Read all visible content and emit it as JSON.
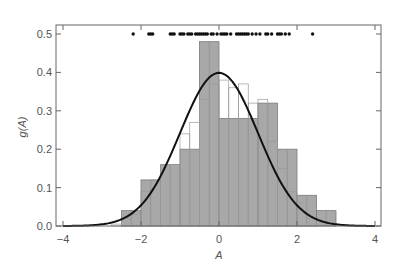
{
  "chart_data": {
    "type": "bar",
    "title": "",
    "xlabel": "A",
    "ylabel": "g(A)",
    "xlim": [
      -4,
      4
    ],
    "ylim": [
      0,
      0.52
    ],
    "xticks": [
      -4,
      -2,
      0,
      2,
      4
    ],
    "xtick_labels": [
      "−4",
      "−2",
      "0",
      "2",
      "4"
    ],
    "yticks": [
      0.0,
      0.1,
      0.2,
      0.3,
      0.4,
      0.5
    ],
    "ytick_labels": [
      "0.0",
      "0.1",
      "0.2",
      "0.3",
      "0.4",
      "0.5"
    ],
    "grid": false,
    "legend": null,
    "series": [
      {
        "name": "histogram (0.5 bins, shaded)",
        "kind": "bar",
        "color": "#a8a8a8",
        "edgecolor": "#7a7a7a",
        "bins": [
          {
            "x0": -2.5,
            "x1": -2.0,
            "value": 0.04
          },
          {
            "x0": -2.0,
            "x1": -1.5,
            "value": 0.12
          },
          {
            "x0": -1.5,
            "x1": -1.0,
            "value": 0.16
          },
          {
            "x0": -1.0,
            "x1": -0.5,
            "value": 0.2
          },
          {
            "x0": -0.5,
            "x1": 0.0,
            "value": 0.48
          },
          {
            "x0": 0.0,
            "x1": 0.5,
            "value": 0.28
          },
          {
            "x0": 0.5,
            "x1": 1.0,
            "value": 0.28
          },
          {
            "x0": 1.0,
            "x1": 1.5,
            "value": 0.32
          },
          {
            "x0": 1.5,
            "x1": 2.0,
            "value": 0.2
          },
          {
            "x0": 2.0,
            "x1": 2.5,
            "value": 0.08
          },
          {
            "x0": 2.5,
            "x1": 3.0,
            "value": 0.04
          }
        ]
      },
      {
        "name": "histogram (0.25 bins, outline)",
        "kind": "bar-outline",
        "color": "#9a9a9a",
        "bins": [
          {
            "x0": -2.75,
            "x1": -2.5,
            "value": 0.005
          },
          {
            "x0": -2.5,
            "x1": -2.25,
            "value": 0.02
          },
          {
            "x0": -2.25,
            "x1": -2.0,
            "value": 0.03
          },
          {
            "x0": -2.0,
            "x1": -1.75,
            "value": 0.09
          },
          {
            "x0": -1.75,
            "x1": -1.5,
            "value": 0.12
          },
          {
            "x0": -1.5,
            "x1": -1.25,
            "value": 0.16
          },
          {
            "x0": -1.25,
            "x1": -1.0,
            "value": 0.16
          },
          {
            "x0": -1.0,
            "x1": -0.75,
            "value": 0.24
          },
          {
            "x0": -0.75,
            "x1": -0.5,
            "value": 0.27
          },
          {
            "x0": -0.5,
            "x1": -0.25,
            "value": 0.33
          },
          {
            "x0": -0.25,
            "x1": 0.0,
            "value": 0.37
          },
          {
            "x0": 0.0,
            "x1": 0.25,
            "value": 0.38
          },
          {
            "x0": 0.25,
            "x1": 0.5,
            "value": 0.36
          },
          {
            "x0": 0.5,
            "x1": 0.75,
            "value": 0.37
          },
          {
            "x0": 0.75,
            "x1": 1.0,
            "value": 0.32
          },
          {
            "x0": 1.0,
            "x1": 1.25,
            "value": 0.33
          },
          {
            "x0": 1.25,
            "x1": 1.5,
            "value": 0.22
          },
          {
            "x0": 1.5,
            "x1": 1.75,
            "value": 0.15
          },
          {
            "x0": 1.75,
            "x1": 2.0,
            "value": 0.09
          },
          {
            "x0": 2.0,
            "x1": 2.25,
            "value": 0.06
          },
          {
            "x0": 2.25,
            "x1": 2.5,
            "value": 0.02
          }
        ]
      },
      {
        "name": "normal density",
        "kind": "line",
        "color": "#111111",
        "mean": 0,
        "sd": 1,
        "peak": 0.399
      },
      {
        "name": "samples",
        "kind": "scatter",
        "y": 0.5,
        "color": "#111111",
        "x": [
          -2.2,
          -1.8,
          -1.75,
          -1.7,
          -1.25,
          -1.2,
          -1.15,
          -1.0,
          -0.95,
          -0.9,
          -0.8,
          -0.75,
          -0.7,
          -0.6,
          -0.55,
          -0.5,
          -0.45,
          -0.4,
          -0.35,
          -0.3,
          -0.2,
          -0.15,
          -0.05,
          0.05,
          0.1,
          0.15,
          0.2,
          0.3,
          0.45,
          0.5,
          0.55,
          0.6,
          0.65,
          0.7,
          0.75,
          0.85,
          0.95,
          1.05,
          1.2,
          1.25,
          1.35,
          1.5,
          1.55,
          1.6,
          1.7,
          1.8,
          2.4
        ]
      }
    ]
  }
}
